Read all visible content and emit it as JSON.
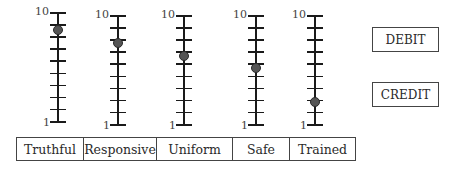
{
  "chart_data": {
    "type": "scatter",
    "title": "",
    "categories": [
      "Truthful",
      "Responsive",
      "Uniform",
      "Safe",
      "Trained"
    ],
    "values": [
      8.5,
      7.7,
      6.6,
      5.6,
      2.8
    ],
    "ylim": [
      1,
      10
    ],
    "tick_labels": {
      "top": "10",
      "bottom": "1"
    },
    "ticks_per_scale": 10,
    "grid": false,
    "legend": null
  },
  "scales": [
    {
      "name": "Truthful",
      "value": 8.5,
      "top_label": "10",
      "bottom_label": "1"
    },
    {
      "name": "Responsive",
      "value": 7.7,
      "top_label": "10",
      "bottom_label": "1"
    },
    {
      "name": "Uniform",
      "value": 6.6,
      "top_label": "10",
      "bottom_label": "1"
    },
    {
      "name": "Safe",
      "value": 5.6,
      "top_label": "10",
      "bottom_label": "1"
    },
    {
      "name": "Trained",
      "value": 2.8,
      "top_label": "10",
      "bottom_label": "1"
    }
  ],
  "buttons": {
    "debit": "DEBIT",
    "credit": "CREDIT"
  },
  "colors": {
    "marker": "#555555",
    "line": "#1a1a1a"
  }
}
